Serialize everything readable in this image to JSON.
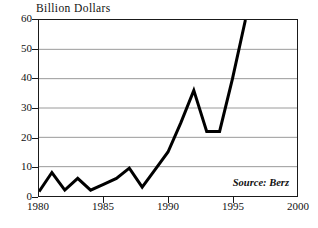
{
  "chart_data": {
    "type": "line",
    "title": "Billion Dollars",
    "xlabel": "",
    "ylabel": "",
    "xlim": [
      1980,
      2000
    ],
    "ylim": [
      0,
      60
    ],
    "grid": "horizontal",
    "legend": "none",
    "annotations": [
      {
        "name": "source-note",
        "text": "Source: Berz",
        "position": "inside-bottom-right",
        "style": "bold-italic-serif"
      }
    ],
    "x_ticks": [
      1980,
      1985,
      1990,
      1995,
      2000
    ],
    "x_tick_labels": [
      "1980",
      "1985",
      "1990",
      "1995",
      "2000"
    ],
    "y_ticks": [
      0,
      10,
      20,
      30,
      40,
      50,
      60
    ],
    "y_tick_labels": [
      "0",
      "10",
      "20",
      "30",
      "40",
      "50",
      "60"
    ],
    "series": [
      {
        "name": "Billion Dollars",
        "color": "#000000",
        "line_width": 3,
        "x": [
          1980,
          1981,
          1982,
          1983,
          1984,
          1985,
          1986,
          1987,
          1988,
          1989,
          1990,
          1991,
          1992,
          1993,
          1994,
          1995,
          1996
        ],
        "values": [
          1.5,
          8,
          2,
          6,
          2,
          4,
          6,
          9.5,
          3,
          9,
          15,
          25,
          36,
          22,
          22,
          40,
          60
        ]
      }
    ]
  },
  "axes": {
    "y_axis": {
      "ticks": [
        {
          "label": "60",
          "value": 60
        },
        {
          "label": "50",
          "value": 50
        },
        {
          "label": "40",
          "value": 40
        },
        {
          "label": "30",
          "value": 30
        },
        {
          "label": "20",
          "value": 20
        },
        {
          "label": "10",
          "value": 10
        },
        {
          "label": "0",
          "value": 0
        }
      ]
    },
    "x_axis": {
      "ticks": [
        {
          "label": "1980",
          "value": 1980
        },
        {
          "label": "1985",
          "value": 1985
        },
        {
          "label": "1990",
          "value": 1990
        },
        {
          "label": "1995",
          "value": 1995
        },
        {
          "label": "2000",
          "value": 2000
        }
      ]
    }
  },
  "colors": {
    "line": "#000000",
    "frame": "#1a1a1a",
    "gridline": "#9a9a9a",
    "background": "#ffffff",
    "text": "#111111"
  }
}
